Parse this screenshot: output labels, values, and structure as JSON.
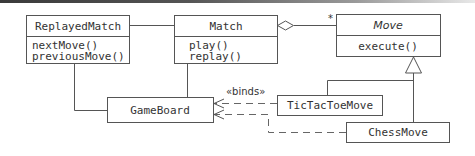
{
  "diagram": {
    "type": "UML class diagram",
    "classes": {
      "replayed_match": {
        "name": "ReplayedMatch",
        "methods": [
          "nextMove()",
          "previousMove()"
        ]
      },
      "match": {
        "name": "Match",
        "methods": [
          "play()",
          "replay()"
        ]
      },
      "move": {
        "name": "Move",
        "abstract": true,
        "methods": [
          "execute()"
        ]
      },
      "game_board": {
        "name": "GameBoard"
      },
      "tictactoe_move": {
        "name": "TicTacToeMove"
      },
      "chess_move": {
        "name": "ChessMove"
      }
    },
    "relationships": {
      "aggregation_multiplicity": "*",
      "binds_label": "«binds»"
    }
  }
}
